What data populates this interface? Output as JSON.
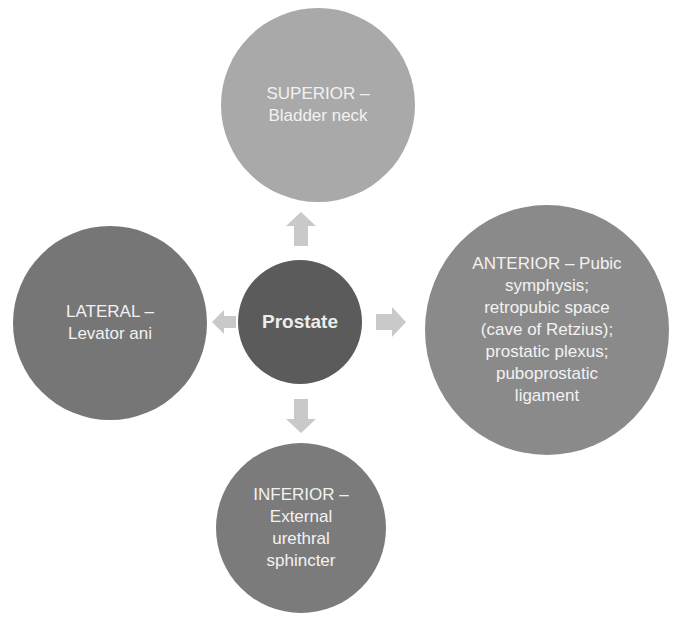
{
  "diagram": {
    "center": {
      "label": "Prostate"
    },
    "nodes": [
      {
        "id": "superior",
        "label": "SUPERIOR –\nBladder neck",
        "color": "#a9a9a9"
      },
      {
        "id": "anterior",
        "label": "ANTERIOR – Pubic\nsymphysis;\nretropubic space\n(cave of Retzius);\nprostatic plexus;\npuboprostatic\nligament",
        "color": "#8a8a8a"
      },
      {
        "id": "inferior",
        "label": "INFERIOR –\nExternal\nurethral\nsphincter",
        "color": "#7b7b7b"
      },
      {
        "id": "lateral",
        "label": "LATERAL –\nLevator ani",
        "color": "#767676"
      }
    ],
    "arrows": [
      {
        "direction": "up",
        "to": "superior"
      },
      {
        "direction": "right",
        "to": "anterior"
      },
      {
        "direction": "down",
        "to": "inferior"
      },
      {
        "direction": "left",
        "to": "lateral"
      }
    ],
    "colors": {
      "center": "#5b5b5b",
      "arrow": "#c9c9c9",
      "text": "#f2f2f2"
    }
  }
}
